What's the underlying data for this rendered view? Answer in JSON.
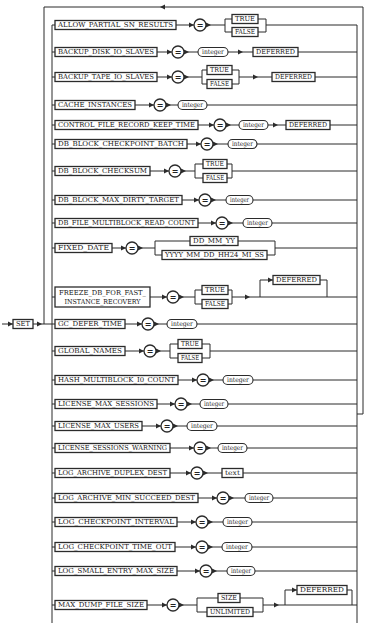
{
  "diagram": {
    "start_keyword": "SET",
    "equals_symbol": "=",
    "rows": [
      {
        "parameter": "ALLOW_PARTIAL_SN_RESULTS",
        "value": {
          "kind": "choice",
          "options": [
            "TRUE",
            "FALSE"
          ]
        }
      },
      {
        "parameter": "BACKUP_DISK_IO_SLAVES",
        "value": {
          "kind": "variable",
          "label": "integer"
        },
        "suffix": {
          "label": "DEFERRED",
          "optional": false
        }
      },
      {
        "parameter": "BACKUP_TAPE_IO_SLAVES",
        "value": {
          "kind": "choice",
          "options": [
            "TRUE",
            "FALSE"
          ]
        },
        "suffix": {
          "label": "DEFERRED",
          "optional": false
        }
      },
      {
        "parameter": "CACHE_INSTANCES",
        "value": {
          "kind": "variable",
          "label": "integer"
        }
      },
      {
        "parameter": "CONTROL_FILE_RECORD_KEEP_TIME",
        "value": {
          "kind": "variable",
          "label": "integer"
        },
        "suffix": {
          "label": "DEFERRED",
          "optional": false
        }
      },
      {
        "parameter": "DB_BLOCK_CHECKPOINT_BATCH",
        "value": {
          "kind": "variable",
          "label": "integer"
        }
      },
      {
        "parameter": "DB_BLOCK_CHECKSUM",
        "value": {
          "kind": "choice",
          "options": [
            "TRUE",
            "FALSE"
          ]
        }
      },
      {
        "parameter": "DB_BLOCK_MAX_DIRTY_TARGET",
        "value": {
          "kind": "variable",
          "label": "integer"
        }
      },
      {
        "parameter": "DB_FILE_MULTIBLOCK_READ_COUNT",
        "value": {
          "kind": "variable",
          "label": "integer"
        }
      },
      {
        "parameter": "FIXED_DATE",
        "value": {
          "kind": "choice",
          "options": [
            "DD_MM_YY",
            "YYYY_MM_DD_HH24_MI_SS"
          ]
        }
      },
      {
        "parameter": "FREEZE_DB_FOR_FAST_INSTANCE_RECOVERY",
        "parameter_lines": [
          "FREEZE_DB_FOR_FAST_",
          "INSTANCE_RECOVERY"
        ],
        "value": {
          "kind": "choice",
          "options": [
            "TRUE",
            "FALSE"
          ]
        },
        "suffix": {
          "label": "DEFERRED",
          "optional": true
        }
      },
      {
        "parameter": "GC_DEFER_TIME",
        "value": {
          "kind": "variable",
          "label": "integer"
        }
      },
      {
        "parameter": "GLOBAL_NAMES",
        "value": {
          "kind": "choice",
          "options": [
            "TRUE",
            "FALSE"
          ]
        }
      },
      {
        "parameter": "HASH_MULTIBLOCK_I0_COUNT",
        "value": {
          "kind": "variable",
          "label": "integer"
        }
      },
      {
        "parameter": "LICENSE_MAX_SESSIONS",
        "value": {
          "kind": "variable",
          "label": "integer"
        }
      },
      {
        "parameter": "LICENSE_MAX_USERS",
        "value": {
          "kind": "variable",
          "label": "integer"
        }
      },
      {
        "parameter": "LICENSE_SESSIONS_WARNING",
        "value": {
          "kind": "variable",
          "label": "integer"
        }
      },
      {
        "parameter": "LOG_ARCHIVE_DUPLEX_DEST",
        "value": {
          "kind": "literal",
          "label": "text"
        }
      },
      {
        "parameter": "LOG_ARCHIVE_MIN_SUCCEED_DEST",
        "value": {
          "kind": "variable",
          "label": "integer"
        }
      },
      {
        "parameter": "LOG_CHECKPOINT_INTERVAL",
        "value": {
          "kind": "variable",
          "label": "integer"
        }
      },
      {
        "parameter": "LOG_CHECKPOINT_TIME_OUT",
        "value": {
          "kind": "variable",
          "label": "integer"
        }
      },
      {
        "parameter": "LOG_SMALL_ENTRY_MAX_SIZE",
        "value": {
          "kind": "variable",
          "label": "integer"
        }
      },
      {
        "parameter": "MAX_DUMP_FILE_SIZE",
        "value": {
          "kind": "choice",
          "options": [
            "SIZE",
            "UNLIMITED"
          ]
        },
        "suffix": {
          "label": "DEFERRED",
          "optional": true
        }
      }
    ]
  }
}
